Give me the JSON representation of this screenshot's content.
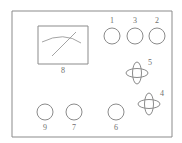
{
  "figure": {
    "name": "control-panel-diagram",
    "type": "line-diagram",
    "stroke_color": "#8b8b8b",
    "label_color": "#6f6f6f",
    "background_color": "#ffffff",
    "panel": {
      "x": 12,
      "y": 11,
      "width": 160,
      "height": 126
    }
  },
  "meter": {
    "label": "8",
    "x": 38,
    "y": 26,
    "width": 50,
    "height": 38,
    "label_x": 63,
    "label_y": 71
  },
  "round_controls": [
    {
      "label": "1",
      "cx": 112,
      "cy": 36,
      "r": 8,
      "label_x": 112,
      "label_y": 21,
      "label_position": "above"
    },
    {
      "label": "3",
      "cx": 135,
      "cy": 36,
      "r": 8,
      "label_x": 135,
      "label_y": 21,
      "label_position": "above"
    },
    {
      "label": "2",
      "cx": 157,
      "cy": 36,
      "r": 8,
      "label_x": 157,
      "label_y": 21,
      "label_position": "above"
    },
    {
      "label": "9",
      "cx": 45,
      "cy": 112,
      "r": 8,
      "label_x": 45,
      "label_y": 128,
      "label_position": "below"
    },
    {
      "label": "7",
      "cx": 74,
      "cy": 112,
      "r": 8,
      "label_x": 74,
      "label_y": 128,
      "label_position": "below"
    },
    {
      "label": "6",
      "cx": 116,
      "cy": 112,
      "r": 8,
      "label_x": 116,
      "label_y": 128,
      "label_position": "below"
    }
  ],
  "knob_controls": [
    {
      "label": "5",
      "cx": 137,
      "cy": 73,
      "rx_v": 4.5,
      "ry_v": 11,
      "rx_h": 11,
      "ry_h": 4.5,
      "label_x": 150,
      "label_y": 63
    },
    {
      "label": "4",
      "cx": 149,
      "cy": 104,
      "rx_v": 4.5,
      "ry_v": 11,
      "rx_h": 11,
      "ry_h": 4.5,
      "label_x": 162,
      "label_y": 94
    }
  ]
}
